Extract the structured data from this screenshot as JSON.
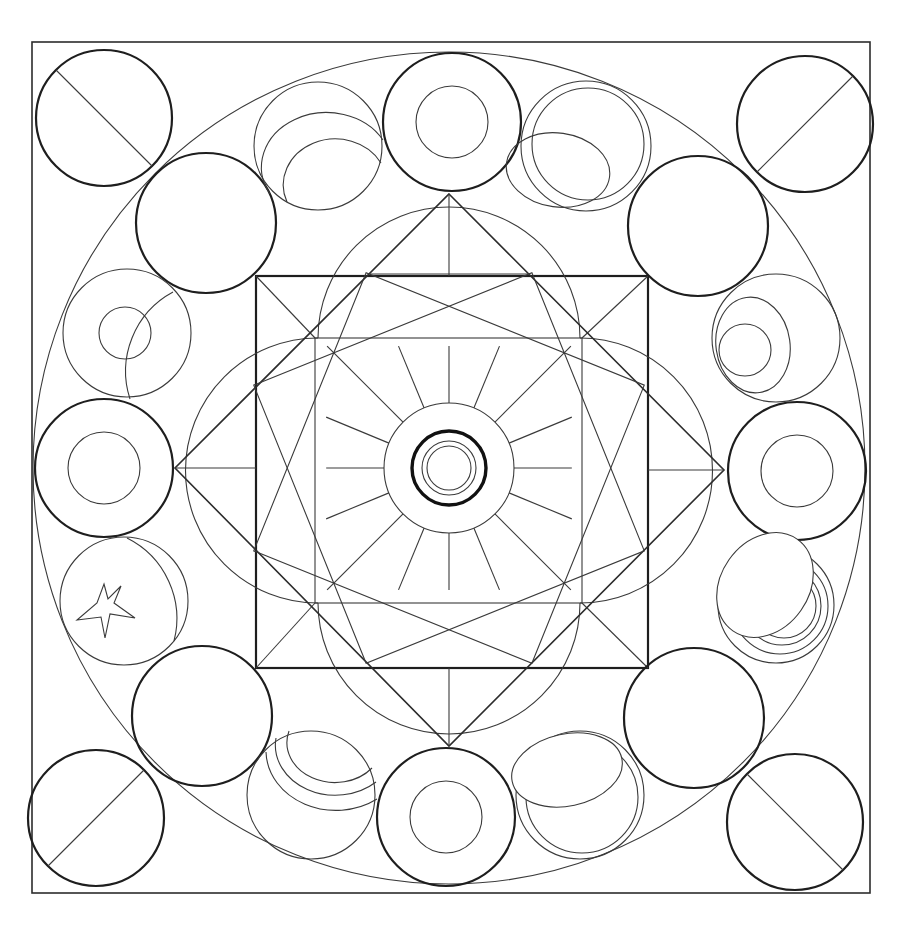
{
  "page": {
    "background": "#ffffff",
    "line_color": "#2c2c2c"
  },
  "drawing": {
    "frame": {
      "x1": 32,
      "y1": 42,
      "x2": 870,
      "y2": 893
    },
    "center": {
      "x": 449,
      "y": 468
    },
    "outer_circle_r": 416,
    "main_square": {
      "x1": 256,
      "y1": 276,
      "x2": 648,
      "y2": 668
    },
    "inner_square": {
      "x1": 315,
      "y1": 338,
      "x2": 582,
      "y2": 603
    },
    "diamond": {
      "top": [
        449,
        194
      ],
      "right": [
        724,
        470
      ],
      "bottom": [
        449,
        746
      ],
      "left": [
        175,
        468
      ]
    },
    "rotated_squares": [
      {
        "half": 150,
        "angle": 22
      },
      {
        "half": 150,
        "angle": -22
      }
    ],
    "hub": {
      "ring_r": 65,
      "bold_r": 37,
      "inner_rings": [
        25,
        20
      ],
      "spokes": 16
    },
    "corner_circles": [
      {
        "name": "top-left",
        "cx": 104,
        "cy": 118,
        "r": 68,
        "slash": "tl-br"
      },
      {
        "name": "top-right",
        "cx": 805,
        "cy": 124,
        "r": 68,
        "slash": "tr-bl"
      },
      {
        "name": "bottom-left",
        "cx": 96,
        "cy": 818,
        "r": 68,
        "slash": "tr-bl"
      },
      {
        "name": "bottom-right",
        "cx": 795,
        "cy": 822,
        "r": 68,
        "slash": "tl-br"
      }
    ],
    "diagonal_circles": [
      {
        "name": "upper-left",
        "cx": 206,
        "cy": 223,
        "r": 70
      },
      {
        "name": "upper-right",
        "cx": 698,
        "cy": 226,
        "r": 70
      },
      {
        "name": "lower-left",
        "cx": 202,
        "cy": 716,
        "r": 70
      },
      {
        "name": "lower-right",
        "cx": 694,
        "cy": 718,
        "r": 70
      }
    ],
    "axis_ring_circles": [
      {
        "name": "top",
        "cx": 452,
        "cy": 122,
        "r": 69,
        "inner_r": 36
      },
      {
        "name": "bottom",
        "cx": 446,
        "cy": 817,
        "r": 69,
        "inner_r": 36
      },
      {
        "name": "left",
        "cx": 104,
        "cy": 468,
        "r": 69,
        "inner_r": 36
      },
      {
        "name": "right",
        "cx": 797,
        "cy": 471,
        "r": 69,
        "inner_r": 36
      }
    ],
    "decorated_circles": [
      {
        "name": "top-left-arcs",
        "cx": 318,
        "cy": 146,
        "r": 64,
        "motif": "double-arc"
      },
      {
        "name": "top-right-ellipse",
        "cx": 586,
        "cy": 146,
        "r": 65,
        "motif": "ellipse"
      },
      {
        "name": "left-upper-eye",
        "cx": 127,
        "cy": 333,
        "r": 64,
        "motif": "crescent-dot"
      },
      {
        "name": "right-upper-eye",
        "cx": 776,
        "cy": 338,
        "r": 64,
        "motif": "ellipse-dot"
      },
      {
        "name": "left-lower-star",
        "cx": 124,
        "cy": 601,
        "r": 64,
        "motif": "star"
      },
      {
        "name": "right-lower-rings",
        "cx": 774,
        "cy": 605,
        "r": 64,
        "motif": "concentric-rings"
      },
      {
        "name": "bottom-left-arcs",
        "cx": 311,
        "cy": 795,
        "r": 64,
        "motif": "triple-arc"
      },
      {
        "name": "bottom-right-ellipse",
        "cx": 580,
        "cy": 795,
        "r": 64,
        "motif": "ellipse"
      }
    ]
  }
}
